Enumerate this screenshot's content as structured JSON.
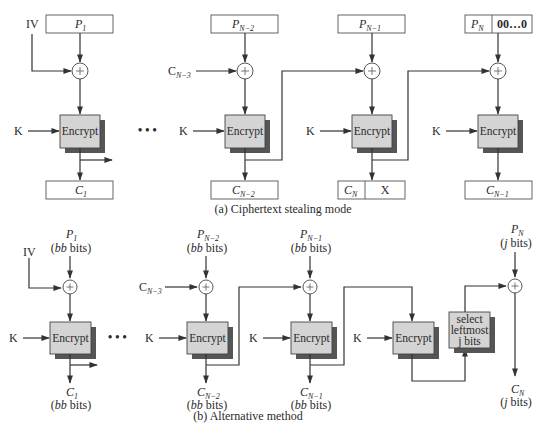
{
  "figure": {
    "part_a": {
      "caption": "(a) Ciphertext stealing mode",
      "iv_label": "IV",
      "key_label": "K",
      "encrypt_label": "Encrypt",
      "ellipsis": "• • •",
      "stage1": {
        "plain_main": "P",
        "plain_sub": "1",
        "cipher_main": "C",
        "cipher_sub": "1"
      },
      "stage2": {
        "plain_main": "P",
        "plain_sub": "N−2",
        "feed_main": "C",
        "feed_sub": "N−3",
        "cipher_main": "C",
        "cipher_sub": "N−2"
      },
      "stage3": {
        "plain_main": "P",
        "plain_sub": "N−1",
        "cipher_left_main": "C",
        "cipher_left_sub": "N",
        "cipher_right": "X"
      },
      "stage4": {
        "plain_left_main": "P",
        "plain_left_sub": "N",
        "plain_right": "00…0",
        "cipher_main": "C",
        "cipher_sub": "N−1"
      }
    },
    "part_b": {
      "caption": "(b) Alternative method",
      "iv_label": "IV",
      "key_label": "K",
      "encrypt_label": "Encrypt",
      "ellipsis": "• • •",
      "bb_bits": "bb",
      "bits_word": " bits)",
      "j_bits": "j",
      "stage1": {
        "plain_main": "P",
        "plain_sub": "1",
        "cipher_main": "C",
        "cipher_sub": "1"
      },
      "stage2": {
        "plain_main": "P",
        "plain_sub": "N−2",
        "feed_main": "C",
        "feed_sub": "N−3",
        "cipher_main": "C",
        "cipher_sub": "N−2"
      },
      "stage3": {
        "plain_main": "P",
        "plain_sub": "N−1",
        "cipher_main": "C",
        "cipher_sub": "N−1"
      },
      "select_box": {
        "line1": "select",
        "line2": "leftmost",
        "line3": "j bits"
      },
      "final": {
        "plain_main": "P",
        "plain_sub": "N",
        "cipher_main": "C",
        "cipher_sub": "N"
      }
    },
    "colors": {
      "encrypt_fill": "#d4d4d4",
      "encrypt_shadow": "#555555",
      "line": "#333333",
      "text": "#2a2a2a"
    }
  }
}
